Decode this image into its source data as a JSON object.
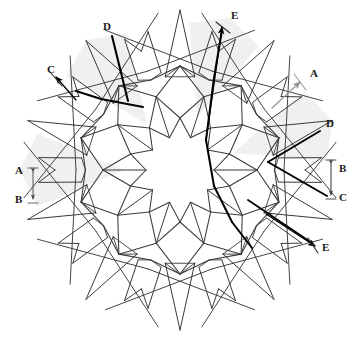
{
  "figure": {
    "type": "geometric-line-diagram",
    "width": 359,
    "height": 344,
    "background_color": "#ffffff",
    "symmetry_order": 10,
    "center": {
      "x": 180,
      "y": 170
    }
  },
  "colors": {
    "line_thin": "#3a3a3a",
    "line_medium": "#2a2a2a",
    "line_heavy": "#000000",
    "line_light": "#9a9a9a",
    "shade_fill": "#f0f0f0",
    "label_text": "#1a1a1a",
    "background": "#ffffff"
  },
  "geometry": {
    "center": {
      "x": 180,
      "y": 170
    },
    "rings": {
      "inner_rosette_radius": 34,
      "rosette_point_radius": 52,
      "petal_inner_radius": 56,
      "petal_outer_radius": 104,
      "hub_radius": 110,
      "spike_base_radius": 118,
      "spike_tip_radius_long": 160,
      "spike_tip_radius_short": 132,
      "notch_radius": 142
    },
    "angles_deg": {
      "start_offset": -90,
      "step": 36
    }
  },
  "labels": [
    {
      "id": "label-a-left",
      "text": "A",
      "x": 15,
      "y": 165,
      "anchor": "start"
    },
    {
      "id": "label-b-left",
      "text": "B",
      "x": 15,
      "y": 194,
      "anchor": "start"
    },
    {
      "id": "label-c-topleft",
      "text": "C",
      "x": 47,
      "y": 64,
      "anchor": "start"
    },
    {
      "id": "label-d-top",
      "text": "D",
      "x": 103,
      "y": 21,
      "anchor": "start"
    },
    {
      "id": "label-e-top",
      "text": "E",
      "x": 231,
      "y": 10,
      "anchor": "start"
    },
    {
      "id": "label-a-topright",
      "text": "A",
      "x": 310,
      "y": 68,
      "anchor": "start"
    },
    {
      "id": "label-d-right",
      "text": "D",
      "x": 326,
      "y": 118,
      "anchor": "start"
    },
    {
      "id": "label-b-right",
      "text": "B",
      "x": 339,
      "y": 163,
      "anchor": "start"
    },
    {
      "id": "label-c-right",
      "text": "C",
      "x": 339,
      "y": 192,
      "anchor": "start"
    },
    {
      "id": "label-e-bottomright",
      "text": "E",
      "x": 322,
      "y": 242,
      "anchor": "start"
    }
  ],
  "annotations": {
    "dimension_left": {
      "name": "A-B vertical dimension",
      "x": 33,
      "y_top": 168,
      "y_bottom": 203,
      "arrow_both_ends": true,
      "color": "#555555"
    },
    "dimension_right": {
      "name": "B-C vertical dimension",
      "x": 331,
      "y_top": 160,
      "y_bottom": 199,
      "arrow_both_ends": true,
      "color": "#333333"
    },
    "leader_c_topleft": {
      "name": "C leader arrow",
      "from": {
        "x": 76,
        "y": 100
      },
      "to": {
        "x": 56,
        "y": 77
      },
      "color": "#000000"
    },
    "leader_d_top": {
      "name": "D heavy crease",
      "from": {
        "x": 128,
        "y": 99
      },
      "to": {
        "x": 112,
        "y": 35
      },
      "color": "#000000"
    },
    "leader_e_top": {
      "name": "E heavy crease with arrow",
      "from": {
        "x": 206,
        "y": 140
      },
      "to": {
        "x": 222,
        "y": 27
      },
      "color": "#000000"
    },
    "leader_a_topright": {
      "name": "A light leader arrow",
      "from": {
        "x": 272,
        "y": 108
      },
      "to": {
        "x": 300,
        "y": 82
      },
      "color": "#9a9a9a"
    },
    "leader_d_right": {
      "name": "D heavy crease right",
      "from": {
        "x": 288,
        "y": 176
      },
      "to": {
        "x": 322,
        "y": 129
      },
      "color": "#000000"
    },
    "leader_e_bottomright": {
      "name": "E leader arrow",
      "from": {
        "x": 266,
        "y": 214
      },
      "to": {
        "x": 315,
        "y": 246
      },
      "color": "#000000"
    }
  },
  "shaded_wedges": [
    {
      "id": "wedge-topleft",
      "center_angle_deg": -126
    },
    {
      "id": "wedge-top",
      "center_angle_deg": -72
    },
    {
      "id": "wedge-topright",
      "center_angle_deg": -18
    },
    {
      "id": "wedge-left",
      "center_angle_deg": 180
    }
  ]
}
